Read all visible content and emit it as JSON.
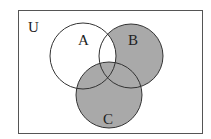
{
  "diagram": {
    "type": "venn",
    "universe_label": "U",
    "sets": [
      {
        "name": "A",
        "label": "A"
      },
      {
        "name": "B",
        "label": "B"
      },
      {
        "name": "C",
        "label": "C"
      }
    ],
    "shaded_region": "C ∪ (B − A)",
    "colors": {
      "shade": "#a9a9a9",
      "stroke": "#333333",
      "background": "#ffffff"
    }
  }
}
